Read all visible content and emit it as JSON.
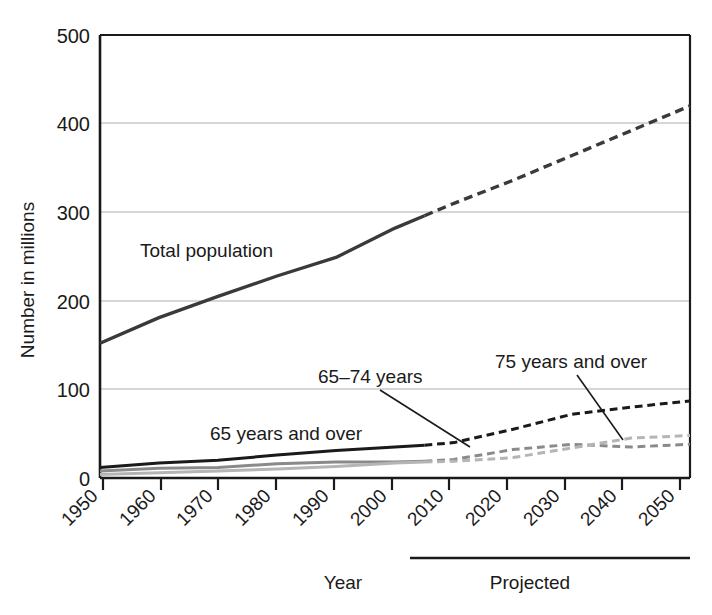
{
  "chart_data": {
    "type": "line",
    "title": "",
    "xlabel": "Year",
    "ylabel": "Number in millions",
    "xlim": [
      1950,
      2050
    ],
    "ylim": [
      0,
      500
    ],
    "yticks": [
      0,
      100,
      200,
      300,
      400,
      500
    ],
    "xticks": [
      1950,
      1960,
      1970,
      1980,
      1990,
      2000,
      2010,
      2020,
      2030,
      2040,
      2050
    ],
    "grid": "horizontal",
    "legend_position": "inline-annotations",
    "projection_note": "Projected",
    "projection_start_year": 2005,
    "x": [
      1950,
      1960,
      1970,
      1980,
      1990,
      2000,
      2005,
      2010,
      2020,
      2030,
      2040,
      2050
    ],
    "series": [
      {
        "name": "Total population",
        "color": "#3a3a3a",
        "values": [
          152,
          181,
          205,
          228,
          249,
          282,
          296,
          310,
          336,
          364,
          392,
          420
        ]
      },
      {
        "name": "65 years and over",
        "color": "#1a1a1a",
        "values": [
          12,
          17,
          20,
          26,
          31,
          35,
          37,
          40,
          55,
          72,
          80,
          87
        ]
      },
      {
        "name": "65–74 years",
        "color": "#8a8a8a",
        "values": [
          8,
          11,
          12,
          16,
          18,
          18,
          19,
          21,
          32,
          38,
          35,
          38
        ]
      },
      {
        "name": "75 years and over",
        "color": "#b5b5b5",
        "values": [
          4,
          6,
          8,
          10,
          13,
          17,
          18,
          19,
          23,
          34,
          45,
          48
        ]
      }
    ]
  },
  "axis": {
    "y_ticks": [
      {
        "value": "500"
      },
      {
        "value": "400"
      },
      {
        "value": "300"
      },
      {
        "value": "200"
      },
      {
        "value": "100"
      },
      {
        "value": "0"
      }
    ],
    "x_ticks": [
      {
        "value": "1950"
      },
      {
        "value": "1960"
      },
      {
        "value": "1970"
      },
      {
        "value": "1980"
      },
      {
        "value": "1990"
      },
      {
        "value": "2000"
      },
      {
        "value": "2010"
      },
      {
        "value": "2020"
      },
      {
        "value": "2030"
      },
      {
        "value": "2040"
      },
      {
        "value": "2050"
      }
    ],
    "y_axis_title": "Number in millions",
    "x_axis_title": "Year"
  },
  "annotations": {
    "total_population": "Total population",
    "sixtyfive_and_over": "65 years and over",
    "sixtyfive_to_seventyfour": "65–74 years",
    "seventyfive_and_over": "75 years and over",
    "projected": "Projected"
  },
  "colors": {
    "total": "#3a3a3a",
    "over65": "#1a1a1a",
    "y65_74": "#8a8a8a",
    "over75": "#b5b5b5",
    "grid": "#c9c9c9",
    "axis": "#1a1a1a",
    "background": "#ffffff"
  }
}
